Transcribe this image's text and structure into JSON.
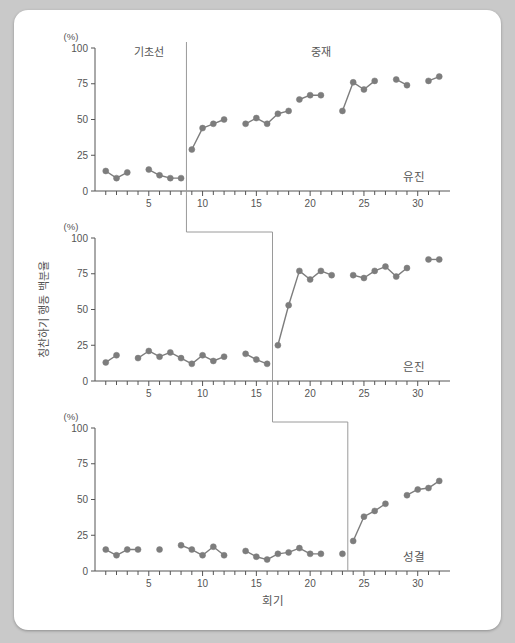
{
  "figure": {
    "y_axis_label": "칭찬하기 행동 백분율",
    "y_axis_unit": "(%)",
    "x_axis_label": "회기",
    "phase_labels": {
      "baseline": "기초선",
      "intervention": "중재"
    },
    "y_ticks": [
      "0",
      "25",
      "50",
      "75",
      "100"
    ],
    "x_ticks_labeled": [
      "5",
      "10",
      "15",
      "20",
      "25",
      "30"
    ],
    "series_color": "#7d7d7d",
    "axis_color": "#555555",
    "background_color": "#ffffff"
  },
  "chart_data": {
    "type": "line",
    "title": "",
    "xlabel": "회기",
    "ylabel": "칭찬하기 행동 백분율",
    "ylim": [
      0,
      100
    ],
    "xlim": [
      0,
      33
    ],
    "yticks": [
      0,
      25,
      50,
      75,
      100
    ],
    "xticks_labeled": [
      5,
      10,
      15,
      20,
      25,
      30
    ],
    "grid": false,
    "legend": "none",
    "design": "multiple-baseline across participants",
    "panels": [
      {
        "name": "유진",
        "phase_change_after_session": 8,
        "annotations": [
          "기초선",
          "중재"
        ],
        "phases": [
          {
            "name": "기초선",
            "x": [
              1,
              2,
              3,
              5,
              6,
              7,
              8
            ],
            "y": [
              14,
              9,
              13,
              15,
              11,
              9,
              9
            ]
          },
          {
            "name": "중재",
            "x": [
              9,
              10,
              11,
              12,
              14,
              15,
              16,
              17,
              18,
              19,
              20,
              21,
              23,
              24,
              25,
              26,
              28,
              29,
              31,
              32
            ],
            "y": [
              29,
              44,
              47,
              50,
              47,
              51,
              54,
              56,
              51,
              57,
              65,
              67,
              67,
              56,
              76,
              72,
              79,
              78,
              78,
              76,
              80
            ]
          }
        ],
        "segments": [
          {
            "x": [
              1,
              2,
              3
            ],
            "y": [
              14,
              9,
              13
            ]
          },
          {
            "x": [
              5,
              6,
              7,
              8
            ],
            "y": [
              15,
              11,
              9,
              9
            ]
          },
          {
            "x": [
              9,
              10,
              11,
              12
            ],
            "y": [
              29,
              44,
              47,
              50
            ]
          },
          {
            "x": [
              14,
              15,
              16,
              17,
              18
            ],
            "y": [
              47,
              51,
              47,
              54,
              56
            ]
          },
          {
            "x": [
              19,
              20,
              21
            ],
            "y": [
              64,
              67,
              67
            ]
          },
          {
            "x": [
              23,
              24,
              25,
              26
            ],
            "y": [
              56,
              76,
              71,
              77
            ]
          },
          {
            "x": [
              28,
              29
            ],
            "y": [
              78,
              74
            ]
          },
          {
            "x": [
              31,
              32
            ],
            "y": [
              77,
              80
            ]
          }
        ]
      },
      {
        "name": "은진",
        "phase_change_after_session": 16,
        "phases": [
          {
            "name": "기초선",
            "x": [
              1,
              2,
              4,
              5,
              6,
              7,
              8,
              9,
              10,
              11,
              12,
              14,
              15,
              16
            ],
            "y": [
              13,
              18,
              16,
              21,
              17,
              20,
              16,
              12,
              18,
              14,
              17,
              19,
              15,
              12
            ]
          },
          {
            "name": "중재",
            "x": [
              17,
              18,
              19,
              20,
              21,
              22,
              24,
              25,
              26,
              27,
              28,
              29,
              31,
              32
            ],
            "y": [
              25,
              53,
              77,
              71,
              77,
              74,
              74,
              72,
              77,
              80,
              73,
              79,
              85,
              85
            ]
          }
        ],
        "segments": [
          {
            "x": [
              1,
              2
            ],
            "y": [
              13,
              18
            ]
          },
          {
            "x": [
              4,
              5,
              6,
              7,
              8,
              9,
              10,
              11,
              12
            ],
            "y": [
              16,
              21,
              17,
              20,
              16,
              12,
              18,
              14,
              17
            ]
          },
          {
            "x": [
              14,
              15,
              16
            ],
            "y": [
              19,
              15,
              12
            ]
          },
          {
            "x": [
              17,
              18,
              19,
              20,
              21,
              22
            ],
            "y": [
              25,
              53,
              77,
              71,
              77,
              74
            ]
          },
          {
            "x": [
              24,
              25,
              26,
              27,
              28,
              29
            ],
            "y": [
              74,
              72,
              77,
              80,
              73,
              79
            ]
          },
          {
            "x": [
              31,
              32
            ],
            "y": [
              85,
              85
            ]
          }
        ]
      },
      {
        "name": "성결",
        "phase_change_after_session": 23,
        "phases": [
          {
            "name": "기초선",
            "x": [
              1,
              2,
              3,
              4,
              6,
              8,
              9,
              10,
              11,
              12,
              14,
              15,
              16,
              17,
              18,
              19,
              20,
              21,
              23
            ],
            "y": [
              15,
              11,
              15,
              15,
              15,
              18,
              15,
              11,
              17,
              11,
              14,
              10,
              8,
              12,
              13,
              16,
              12,
              12,
              12
            ]
          },
          {
            "name": "중재",
            "x": [
              24,
              25,
              26,
              27,
              29,
              30,
              31,
              32
            ],
            "y": [
              21,
              38,
              42,
              47,
              53,
              57,
              58,
              63
            ]
          }
        ],
        "segments": [
          {
            "x": [
              1,
              2,
              3,
              4
            ],
            "y": [
              15,
              11,
              15,
              15
            ]
          },
          {
            "x": [
              6
            ],
            "y": [
              15
            ]
          },
          {
            "x": [
              8,
              9,
              10,
              11,
              12
            ],
            "y": [
              18,
              15,
              11,
              17,
              11
            ]
          },
          {
            "x": [
              14,
              15,
              16,
              17,
              18,
              19,
              20,
              21
            ],
            "y": [
              14,
              10,
              8,
              12,
              13,
              16,
              12,
              12
            ]
          },
          {
            "x": [
              23
            ],
            "y": [
              12
            ]
          },
          {
            "x": [
              24,
              25,
              26,
              27
            ],
            "y": [
              21,
              38,
              42,
              47
            ]
          },
          {
            "x": [
              29,
              30,
              31,
              32
            ],
            "y": [
              53,
              57,
              58,
              63
            ]
          }
        ]
      }
    ]
  }
}
